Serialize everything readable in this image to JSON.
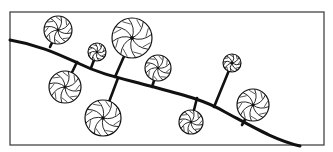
{
  "figure": {
    "frame": {
      "x": 10,
      "y": 12,
      "w": 314,
      "h": 133
    },
    "stem_path": "M10,40 C40,45 60,55 80,64 C100,74 120,78 150,86 C180,94 205,100 225,112 C255,128 275,140 300,146",
    "discs": [
      {
        "id": "d1",
        "cx": 58,
        "cy": 30,
        "r": 14,
        "ax": 50,
        "ay": 47
      },
      {
        "id": "d2",
        "cx": 97,
        "cy": 52,
        "r": 9,
        "ax": 91,
        "ay": 68
      },
      {
        "id": "d3",
        "cx": 132,
        "cy": 38,
        "r": 20,
        "ax": 115,
        "ay": 77
      },
      {
        "id": "d4",
        "cx": 158,
        "cy": 68,
        "r": 13,
        "ax": 152,
        "ay": 87
      },
      {
        "id": "d5",
        "cx": 65,
        "cy": 87,
        "r": 16,
        "ax": 77,
        "ay": 62
      },
      {
        "id": "d6",
        "cx": 103,
        "cy": 118,
        "r": 18,
        "ax": 118,
        "ay": 78
      },
      {
        "id": "d7",
        "cx": 232,
        "cy": 63,
        "r": 9,
        "ax": 214,
        "ay": 107
      },
      {
        "id": "d8",
        "cx": 191,
        "cy": 122,
        "r": 12,
        "ax": 197,
        "ay": 98
      },
      {
        "id": "d9",
        "cx": 253,
        "cy": 105,
        "r": 16,
        "ax": 242,
        "ay": 125
      }
    ],
    "colors": {
      "ink": "#111111",
      "frame": "#444444",
      "background": "#ffffff"
    }
  }
}
